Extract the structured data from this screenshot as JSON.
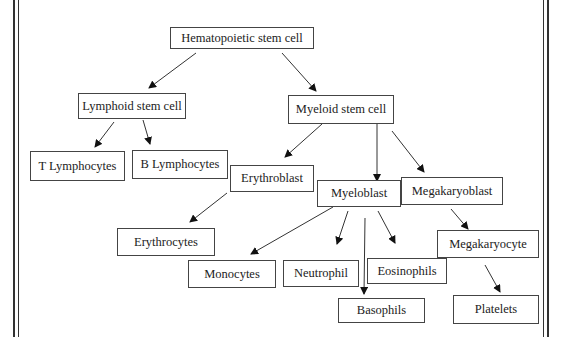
{
  "diagram": {
    "nodes": {
      "hsc": "Hematopoietic stem cell",
      "lymphoid": "Lymphoid stem cell",
      "myeloid": "Myeloid stem cell",
      "t_lymph": "T Lymphocytes",
      "b_lymph": "B Lymphocytes",
      "erythroblast": "Erythroblast",
      "myeloblast": "Myeloblast",
      "megakaryoblast": "Megakaryoblast",
      "erythrocytes": "Erythrocytes",
      "monocytes": "Monocytes",
      "neutrophil": "Neutrophil",
      "eosinophils": "Eosinophils",
      "basophils": "Basophils",
      "megakaryocyte": "Megakaryocyte",
      "platelets": "Platelets"
    },
    "edges": [
      [
        "hsc",
        "lymphoid"
      ],
      [
        "hsc",
        "myeloid"
      ],
      [
        "lymphoid",
        "t_lymph"
      ],
      [
        "lymphoid",
        "b_lymph"
      ],
      [
        "myeloid",
        "erythroblast"
      ],
      [
        "myeloid",
        "myeloblast"
      ],
      [
        "myeloid",
        "megakaryoblast"
      ],
      [
        "erythroblast",
        "erythrocytes"
      ],
      [
        "myeloblast",
        "monocytes"
      ],
      [
        "myeloblast",
        "neutrophil"
      ],
      [
        "myeloblast",
        "basophils"
      ],
      [
        "myeloblast",
        "eosinophils"
      ],
      [
        "megakaryoblast",
        "megakaryocyte"
      ],
      [
        "megakaryocyte",
        "platelets"
      ]
    ]
  }
}
